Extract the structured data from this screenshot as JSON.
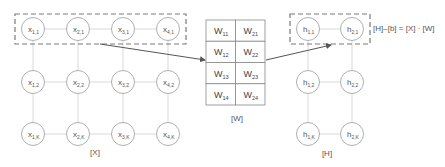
{
  "x_matrix": {
    "caption": "[X]",
    "nodes": [
      {
        "base": "x",
        "sub": "1,1",
        "cx": 33,
        "cy": 29
      },
      {
        "base": "x",
        "sub": "2,1",
        "cx": 78,
        "cy": 29
      },
      {
        "base": "x",
        "sub": "3,1",
        "cx": 123,
        "cy": 29
      },
      {
        "base": "x",
        "sub": "4,1",
        "cx": 168,
        "cy": 29
      },
      {
        "base": "x",
        "sub": "1,2",
        "cx": 33,
        "cy": 82
      },
      {
        "base": "x",
        "sub": "2,2",
        "cx": 78,
        "cy": 82
      },
      {
        "base": "x",
        "sub": "3,2",
        "cx": 123,
        "cy": 82
      },
      {
        "base": "x",
        "sub": "4,2",
        "cx": 168,
        "cy": 82
      },
      {
        "base": "x",
        "sub": "1,K",
        "cx": 33,
        "cy": 134
      },
      {
        "base": "x",
        "sub": "2,K",
        "cx": 78,
        "cy": 134
      },
      {
        "base": "x",
        "sub": "3,K",
        "cx": 123,
        "cy": 134
      },
      {
        "base": "x",
        "sub": "4,K",
        "cx": 168,
        "cy": 134
      }
    ]
  },
  "w_matrix": {
    "caption": "[W]",
    "cells": [
      [
        {
          "base": "W",
          "sub": "11"
        },
        {
          "base": "W",
          "sub": "21"
        }
      ],
      [
        {
          "base": "W",
          "sub": "12"
        },
        {
          "base": "W",
          "sub": "22"
        }
      ],
      [
        {
          "base": "W",
          "sub": "13"
        },
        {
          "base": "W",
          "sub": "23"
        }
      ],
      [
        {
          "base": "W",
          "sub": "14"
        },
        {
          "base": "W",
          "sub": "24"
        }
      ]
    ]
  },
  "h_matrix": {
    "caption": "[H]",
    "nodes": [
      {
        "base": "h",
        "sub": "1,1",
        "cx": 308,
        "cy": 29
      },
      {
        "base": "h",
        "sub": "2,1",
        "cx": 352,
        "cy": 29
      },
      {
        "base": "h",
        "sub": "1,2",
        "cx": 308,
        "cy": 82
      },
      {
        "base": "h",
        "sub": "2,2",
        "cx": 352,
        "cy": 82
      },
      {
        "base": "h",
        "sub": "1,K",
        "cx": 308,
        "cy": 134
      },
      {
        "base": "h",
        "sub": "2,K",
        "cx": 352,
        "cy": 134
      }
    ]
  },
  "formula": "[H]–[b] = [X] · [W]",
  "colors": {
    "node_stroke": "#9a9a9a",
    "edge": "#cfcfcf",
    "dash": "#7a7a7a",
    "arrow": "#555555"
  }
}
